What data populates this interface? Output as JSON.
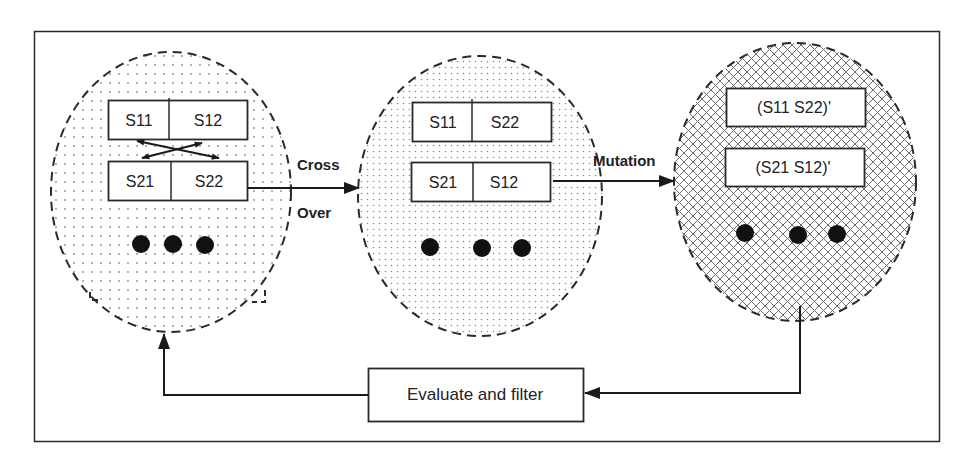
{
  "colors": {
    "stroke": "#2a2a2a",
    "background": "#ffffff",
    "dot_fill": "#111111",
    "pattern_dot": "#8a8a8a",
    "hatch": "#6e6e6e"
  },
  "populations": [
    {
      "id": "parents",
      "fill_pattern": "dots",
      "chromosomes": [
        {
          "left": "S11",
          "right": "S12"
        },
        {
          "left": "S21",
          "right": "S22"
        }
      ],
      "ellipsis": "•••",
      "crossover_arrows": true
    },
    {
      "id": "offspring",
      "fill_pattern": "dense-dots",
      "chromosomes": [
        {
          "left": "S11",
          "right": "S22"
        },
        {
          "left": "S21",
          "right": "S12"
        }
      ],
      "ellipsis": "•••"
    },
    {
      "id": "mutated",
      "fill_pattern": "crosshatch",
      "chromosomes": [
        {
          "label": "(S11 S22)'"
        },
        {
          "label": "(S21 S12)'"
        }
      ],
      "ellipsis": "•••"
    }
  ],
  "edges": {
    "crossover": {
      "line1": "Cross",
      "line2": "Over"
    },
    "mutation": {
      "label": "Mutation"
    },
    "evaluate": {
      "label": "Evaluate and filter"
    }
  }
}
